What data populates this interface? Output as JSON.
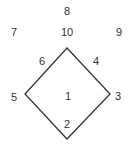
{
  "diagram": {
    "type": "diamond-labeled-regions",
    "stroke_color": "#333333",
    "shape": {
      "vertices": {
        "top": [
          67,
          48
        ],
        "right": [
          110,
          94
        ],
        "bottom": [
          67,
          139
        ],
        "left": [
          25,
          94
        ]
      }
    },
    "labels": [
      {
        "id": "1",
        "text": "1",
        "x": 68,
        "y": 96,
        "role": "interior"
      },
      {
        "id": "2",
        "text": "2",
        "x": 67,
        "y": 124,
        "role": "bottom-vertex-inside"
      },
      {
        "id": "3",
        "text": "3",
        "x": 118,
        "y": 96,
        "role": "right-vertex"
      },
      {
        "id": "4",
        "text": "4",
        "x": 96,
        "y": 61,
        "role": "upper-right-edge"
      },
      {
        "id": "5",
        "text": "5",
        "x": 14,
        "y": 97,
        "role": "left-vertex"
      },
      {
        "id": "6",
        "text": "6",
        "x": 42,
        "y": 61,
        "role": "upper-left-edge"
      },
      {
        "id": "7",
        "text": "7",
        "x": 14,
        "y": 32,
        "role": "outer-left"
      },
      {
        "id": "8",
        "text": "8",
        "x": 67,
        "y": 11,
        "role": "outer-top"
      },
      {
        "id": "9",
        "text": "9",
        "x": 119,
        "y": 32,
        "role": "outer-right"
      },
      {
        "id": "10",
        "text": "10",
        "x": 67,
        "y": 32,
        "role": "top-vertex-above"
      }
    ]
  }
}
